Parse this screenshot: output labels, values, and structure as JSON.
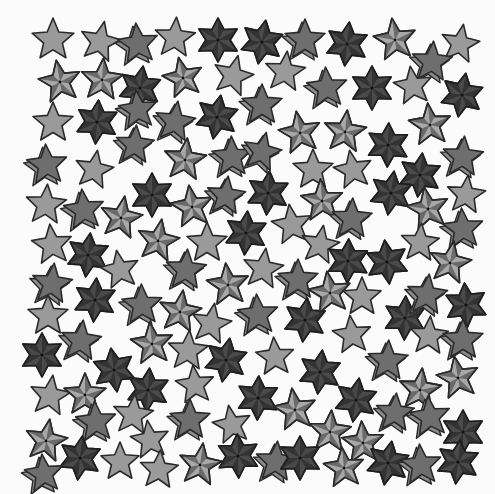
{
  "image": {
    "width": 495,
    "height": 494,
    "background": "#fbfbfb",
    "description": "Grayscale pattern of scattered star illustrations"
  },
  "palette": {
    "outline": "#2a2a2a",
    "plain_fill": "#9a9a9a",
    "nautical_light": "#a8a8a8",
    "nautical_dark": "#6a6a6a",
    "hexa_fill": "#4a4a4a",
    "hexa_facet": "#333333",
    "shadow_fill": "#6e6e6e",
    "shadow_side": "#8c8c8c"
  },
  "star_types": [
    "plain",
    "nautical",
    "hexa",
    "shadow"
  ],
  "stars": [
    {
      "x": 53,
      "y": 40,
      "t": "plain",
      "r": 22,
      "a": 0
    },
    {
      "x": 100,
      "y": 42,
      "t": "plain",
      "r": 21,
      "a": 12
    },
    {
      "x": 138,
      "y": 44,
      "t": "shadow",
      "r": 21,
      "a": -6
    },
    {
      "x": 175,
      "y": 38,
      "t": "plain",
      "r": 21,
      "a": 4
    },
    {
      "x": 218,
      "y": 40,
      "t": "hexa",
      "r": 22,
      "a": 0
    },
    {
      "x": 262,
      "y": 42,
      "t": "hexa",
      "r": 22,
      "a": 10
    },
    {
      "x": 305,
      "y": 40,
      "t": "shadow",
      "r": 21,
      "a": 0
    },
    {
      "x": 347,
      "y": 44,
      "t": "hexa",
      "r": 22,
      "a": 6
    },
    {
      "x": 395,
      "y": 40,
      "t": "nautical",
      "r": 22,
      "a": -8
    },
    {
      "x": 460,
      "y": 44,
      "t": "plain",
      "r": 20,
      "a": 10
    },
    {
      "x": 432,
      "y": 62,
      "t": "shadow",
      "r": 21,
      "a": 4
    },
    {
      "x": 60,
      "y": 82,
      "t": "nautical",
      "r": 22,
      "a": -10
    },
    {
      "x": 102,
      "y": 80,
      "t": "nautical",
      "r": 22,
      "a": 4
    },
    {
      "x": 140,
      "y": 88,
      "t": "hexa",
      "r": 22,
      "a": 8
    },
    {
      "x": 183,
      "y": 78,
      "t": "nautical",
      "r": 21,
      "a": -12
    },
    {
      "x": 233,
      "y": 76,
      "t": "plain",
      "r": 21,
      "a": 14
    },
    {
      "x": 285,
      "y": 72,
      "t": "plain",
      "r": 21,
      "a": 6
    },
    {
      "x": 327,
      "y": 88,
      "t": "shadow",
      "r": 21,
      "a": -4
    },
    {
      "x": 372,
      "y": 88,
      "t": "hexa",
      "r": 22,
      "a": 0
    },
    {
      "x": 413,
      "y": 86,
      "t": "plain",
      "r": 20,
      "a": -8
    },
    {
      "x": 462,
      "y": 95,
      "t": "hexa",
      "r": 22,
      "a": 10
    },
    {
      "x": 53,
      "y": 123,
      "t": "plain",
      "r": 21,
      "a": 0
    },
    {
      "x": 97,
      "y": 122,
      "t": "hexa",
      "r": 22,
      "a": 4
    },
    {
      "x": 138,
      "y": 110,
      "t": "shadow",
      "r": 20,
      "a": -6
    },
    {
      "x": 175,
      "y": 122,
      "t": "shadow",
      "r": 21,
      "a": 8
    },
    {
      "x": 217,
      "y": 117,
      "t": "hexa",
      "r": 22,
      "a": 10
    },
    {
      "x": 262,
      "y": 105,
      "t": "shadow",
      "r": 21,
      "a": 0
    },
    {
      "x": 300,
      "y": 133,
      "t": "nautical",
      "r": 22,
      "a": -10
    },
    {
      "x": 345,
      "y": 132,
      "t": "nautical",
      "r": 22,
      "a": 6
    },
    {
      "x": 388,
      "y": 145,
      "t": "hexa",
      "r": 22,
      "a": 2
    },
    {
      "x": 430,
      "y": 125,
      "t": "nautical",
      "r": 22,
      "a": -6
    },
    {
      "x": 135,
      "y": 145,
      "t": "shadow",
      "r": 20,
      "a": 4
    },
    {
      "x": 47,
      "y": 165,
      "t": "shadow",
      "r": 21,
      "a": -4
    },
    {
      "x": 94,
      "y": 170,
      "t": "plain",
      "r": 20,
      "a": 10
    },
    {
      "x": 185,
      "y": 160,
      "t": "nautical",
      "r": 22,
      "a": 6
    },
    {
      "x": 232,
      "y": 157,
      "t": "shadow",
      "r": 21,
      "a": -2
    },
    {
      "x": 262,
      "y": 152,
      "t": "shadow",
      "r": 20,
      "a": 12
    },
    {
      "x": 313,
      "y": 170,
      "t": "plain",
      "r": 21,
      "a": 0
    },
    {
      "x": 353,
      "y": 170,
      "t": "plain",
      "r": 20,
      "a": -10
    },
    {
      "x": 420,
      "y": 175,
      "t": "hexa",
      "r": 22,
      "a": 6
    },
    {
      "x": 463,
      "y": 157,
      "t": "shadow",
      "r": 21,
      "a": 4
    },
    {
      "x": 46,
      "y": 205,
      "t": "plain",
      "r": 21,
      "a": 4
    },
    {
      "x": 84,
      "y": 210,
      "t": "shadow",
      "r": 21,
      "a": -6
    },
    {
      "x": 121,
      "y": 218,
      "t": "nautical",
      "r": 22,
      "a": 10
    },
    {
      "x": 152,
      "y": 195,
      "t": "hexa",
      "r": 22,
      "a": 0
    },
    {
      "x": 192,
      "y": 207,
      "t": "nautical",
      "r": 22,
      "a": -8
    },
    {
      "x": 226,
      "y": 196,
      "t": "shadow",
      "r": 20,
      "a": 6
    },
    {
      "x": 268,
      "y": 193,
      "t": "hexa",
      "r": 22,
      "a": 4
    },
    {
      "x": 322,
      "y": 201,
      "t": "nautical",
      "r": 22,
      "a": -4
    },
    {
      "x": 352,
      "y": 219,
      "t": "shadow",
      "r": 21,
      "a": 2
    },
    {
      "x": 391,
      "y": 193,
      "t": "hexa",
      "r": 22,
      "a": 8
    },
    {
      "x": 428,
      "y": 209,
      "t": "nautical",
      "r": 22,
      "a": -10
    },
    {
      "x": 466,
      "y": 195,
      "t": "plain",
      "r": 20,
      "a": 6
    },
    {
      "x": 52,
      "y": 245,
      "t": "plain",
      "r": 21,
      "a": -6
    },
    {
      "x": 88,
      "y": 255,
      "t": "hexa",
      "r": 22,
      "a": 6
    },
    {
      "x": 158,
      "y": 241,
      "t": "nautical",
      "r": 22,
      "a": 10
    },
    {
      "x": 207,
      "y": 243,
      "t": "plain",
      "r": 21,
      "a": 0
    },
    {
      "x": 246,
      "y": 233,
      "t": "hexa",
      "r": 22,
      "a": 4
    },
    {
      "x": 292,
      "y": 225,
      "t": "plain",
      "r": 21,
      "a": -8
    },
    {
      "x": 320,
      "y": 245,
      "t": "plain",
      "r": 20,
      "a": 10
    },
    {
      "x": 348,
      "y": 261,
      "t": "hexa",
      "r": 22,
      "a": 2
    },
    {
      "x": 387,
      "y": 262,
      "t": "hexa",
      "r": 22,
      "a": -6
    },
    {
      "x": 420,
      "y": 243,
      "t": "plain",
      "r": 20,
      "a": 4
    },
    {
      "x": 463,
      "y": 229,
      "t": "shadow",
      "r": 21,
      "a": -4
    },
    {
      "x": 52,
      "y": 284,
      "t": "shadow",
      "r": 21,
      "a": 6
    },
    {
      "x": 120,
      "y": 270,
      "t": "plain",
      "r": 20,
      "a": -10
    },
    {
      "x": 186,
      "y": 270,
      "t": "shadow",
      "r": 21,
      "a": 4
    },
    {
      "x": 228,
      "y": 285,
      "t": "nautical",
      "r": 22,
      "a": -6
    },
    {
      "x": 263,
      "y": 269,
      "t": "plain",
      "r": 21,
      "a": 8
    },
    {
      "x": 298,
      "y": 280,
      "t": "shadow",
      "r": 21,
      "a": 0
    },
    {
      "x": 450,
      "y": 263,
      "t": "nautical",
      "r": 22,
      "a": 10
    },
    {
      "x": 95,
      "y": 300,
      "t": "hexa",
      "r": 22,
      "a": 4
    },
    {
      "x": 142,
      "y": 305,
      "t": "shadow",
      "r": 21,
      "a": -2
    },
    {
      "x": 180,
      "y": 312,
      "t": "nautical",
      "r": 22,
      "a": 8
    },
    {
      "x": 258,
      "y": 315,
      "t": "shadow",
      "r": 21,
      "a": -4
    },
    {
      "x": 305,
      "y": 320,
      "t": "hexa",
      "r": 22,
      "a": 6
    },
    {
      "x": 330,
      "y": 293,
      "t": "nautical",
      "r": 22,
      "a": -8
    },
    {
      "x": 362,
      "y": 297,
      "t": "plain",
      "r": 20,
      "a": 0
    },
    {
      "x": 405,
      "y": 318,
      "t": "hexa",
      "r": 22,
      "a": 2
    },
    {
      "x": 427,
      "y": 295,
      "t": "shadow",
      "r": 21,
      "a": 6
    },
    {
      "x": 466,
      "y": 305,
      "t": "hexa",
      "r": 22,
      "a": -4
    },
    {
      "x": 48,
      "y": 316,
      "t": "plain",
      "r": 21,
      "a": 0
    },
    {
      "x": 211,
      "y": 324,
      "t": "plain",
      "r": 21,
      "a": 10
    },
    {
      "x": 352,
      "y": 335,
      "t": "plain",
      "r": 20,
      "a": -6
    },
    {
      "x": 429,
      "y": 336,
      "t": "plain",
      "r": 20,
      "a": 4
    },
    {
      "x": 463,
      "y": 340,
      "t": "shadow",
      "r": 21,
      "a": 0
    },
    {
      "x": 81,
      "y": 341,
      "t": "shadow",
      "r": 21,
      "a": 6
    },
    {
      "x": 152,
      "y": 344,
      "t": "nautical",
      "r": 22,
      "a": -6
    },
    {
      "x": 42,
      "y": 355,
      "t": "hexa",
      "r": 22,
      "a": 0
    },
    {
      "x": 188,
      "y": 351,
      "t": "plain",
      "r": 21,
      "a": 4
    },
    {
      "x": 226,
      "y": 360,
      "t": "hexa",
      "r": 22,
      "a": 10
    },
    {
      "x": 275,
      "y": 357,
      "t": "plain",
      "r": 20,
      "a": -4
    },
    {
      "x": 388,
      "y": 361,
      "t": "shadow",
      "r": 21,
      "a": 2
    },
    {
      "x": 114,
      "y": 370,
      "t": "hexa",
      "r": 22,
      "a": -8
    },
    {
      "x": 320,
      "y": 372,
      "t": "hexa",
      "r": 22,
      "a": 6
    },
    {
      "x": 458,
      "y": 378,
      "t": "nautical",
      "r": 22,
      "a": -10
    },
    {
      "x": 50,
      "y": 396,
      "t": "plain",
      "r": 21,
      "a": 8
    },
    {
      "x": 85,
      "y": 395,
      "t": "nautical",
      "r": 22,
      "a": 0
    },
    {
      "x": 148,
      "y": 390,
      "t": "hexa",
      "r": 22,
      "a": 4
    },
    {
      "x": 195,
      "y": 385,
      "t": "plain",
      "r": 20,
      "a": -6
    },
    {
      "x": 258,
      "y": 398,
      "t": "hexa",
      "r": 22,
      "a": 2
    },
    {
      "x": 295,
      "y": 410,
      "t": "nautical",
      "r": 22,
      "a": -8
    },
    {
      "x": 356,
      "y": 400,
      "t": "hexa",
      "r": 22,
      "a": 8
    },
    {
      "x": 420,
      "y": 390,
      "t": "nautical",
      "r": 22,
      "a": 6
    },
    {
      "x": 96,
      "y": 422,
      "t": "shadow",
      "r": 21,
      "a": -4
    },
    {
      "x": 133,
      "y": 415,
      "t": "plain",
      "r": 21,
      "a": 6
    },
    {
      "x": 190,
      "y": 420,
      "t": "shadow",
      "r": 21,
      "a": 0
    },
    {
      "x": 232,
      "y": 425,
      "t": "plain",
      "r": 20,
      "a": -10
    },
    {
      "x": 395,
      "y": 413,
      "t": "shadow",
      "r": 20,
      "a": 4
    },
    {
      "x": 430,
      "y": 417,
      "t": "shadow",
      "r": 21,
      "a": -6
    },
    {
      "x": 46,
      "y": 441,
      "t": "nautical",
      "r": 22,
      "a": 10
    },
    {
      "x": 150,
      "y": 440,
      "t": "plain",
      "r": 20,
      "a": -8
    },
    {
      "x": 330,
      "y": 432,
      "t": "nautical",
      "r": 22,
      "a": 4
    },
    {
      "x": 363,
      "y": 443,
      "t": "nautical",
      "r": 22,
      "a": -4
    },
    {
      "x": 463,
      "y": 432,
      "t": "hexa",
      "r": 22,
      "a": 0
    },
    {
      "x": 80,
      "y": 458,
      "t": "hexa",
      "r": 22,
      "a": 6
    },
    {
      "x": 120,
      "y": 462,
      "t": "plain",
      "r": 20,
      "a": 0
    },
    {
      "x": 200,
      "y": 465,
      "t": "nautical",
      "r": 22,
      "a": 8
    },
    {
      "x": 238,
      "y": 456,
      "t": "hexa",
      "r": 22,
      "a": -2
    },
    {
      "x": 276,
      "y": 462,
      "t": "shadow",
      "r": 21,
      "a": 4
    },
    {
      "x": 300,
      "y": 458,
      "t": "hexa",
      "r": 22,
      "a": 0
    },
    {
      "x": 344,
      "y": 468,
      "t": "nautical",
      "r": 21,
      "a": -6
    },
    {
      "x": 388,
      "y": 463,
      "t": "hexa",
      "r": 22,
      "a": 10
    },
    {
      "x": 421,
      "y": 465,
      "t": "shadow",
      "r": 21,
      "a": -4
    },
    {
      "x": 458,
      "y": 462,
      "t": "hexa",
      "r": 22,
      "a": 6
    },
    {
      "x": 159,
      "y": 470,
      "t": "plain",
      "r": 20,
      "a": 4
    },
    {
      "x": 44,
      "y": 474,
      "t": "shadow",
      "r": 20,
      "a": -6
    }
  ]
}
